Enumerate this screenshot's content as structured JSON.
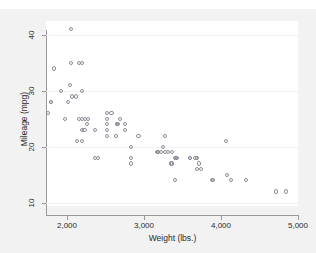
{
  "top_strip": {
    "ghost_text": "g  p  y       g      g   g"
  },
  "chart_data": {
    "type": "scatter",
    "title": "",
    "xlabel": "Weight (lbs.)",
    "ylabel": "Mileage (mpg)",
    "xlim": [
      1730,
      5000
    ],
    "ylim": [
      9.4,
      42.5
    ],
    "xticks": [
      2000,
      3000,
      4000,
      5000
    ],
    "xticklabels": [
      "2,000",
      "3,000",
      "4,000",
      "5,000"
    ],
    "yticks": [
      10,
      20,
      30,
      40
    ],
    "yticklabels": [
      "10",
      "20",
      "30",
      "40"
    ],
    "grid": "horizontal",
    "legend": "none",
    "marker": "open-circle",
    "marker_color": "#8e8e99",
    "plot_background": "#ffffff",
    "canvas_background": "#f2f2f2",
    "x": [
      2930,
      3350,
      2640,
      3250,
      4080,
      3670,
      3690,
      3180,
      3220,
      4060,
      3600,
      3600,
      3740,
      4130,
      3720,
      3370,
      3400,
      2830,
      3370,
      2020,
      2280,
      3280,
      2750,
      3430,
      2120,
      2520,
      2650,
      2200,
      2520,
      2830,
      3310,
      2200,
      2520,
      2830,
      2200,
      2200,
      2520,
      3420,
      3690,
      3180,
      3280,
      3880,
      3400,
      2200,
      2520,
      1800,
      1800,
      1830,
      2160,
      2040,
      1920,
      2580,
      2670,
      2160,
      2370,
      2050,
      1980,
      2240,
      2260,
      2750,
      2370,
      2130,
      2650,
      1760,
      2070,
      2050,
      2410,
      2230,
      2690,
      3170,
      4720,
      4840,
      4330,
      3900
    ],
    "y": [
      22,
      17,
      22,
      20,
      15,
      18,
      18,
      19,
      19,
      21,
      18,
      18,
      16,
      14,
      17,
      17,
      14,
      17,
      19,
      28,
      25,
      19,
      24,
      18,
      29,
      26,
      24,
      25,
      22,
      18,
      19,
      21,
      23,
      20,
      30,
      35,
      25,
      18,
      16,
      19,
      22,
      14,
      18,
      23,
      24,
      28,
      28,
      34,
      35,
      31,
      30,
      26,
      24,
      25,
      23,
      41,
      25,
      25,
      24,
      23,
      18,
      21,
      24,
      26,
      29,
      35,
      18,
      23,
      25,
      19,
      12,
      12,
      14,
      14
    ]
  }
}
